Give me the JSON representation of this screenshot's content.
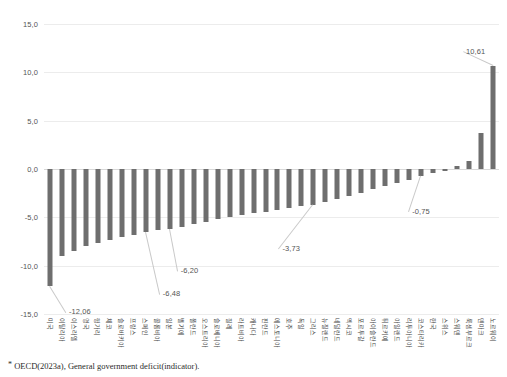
{
  "footnote": {
    "marker": "*",
    "text": "OECD(2023a), General government deficit(indicator)."
  },
  "chart_data": {
    "type": "bar",
    "title": "",
    "subtitle": "",
    "xlabel": "",
    "ylabel": "",
    "ylim": [
      -15.0,
      15.0
    ],
    "ytick_labels": [
      "15,0",
      "10,0",
      "5,0",
      "0,0",
      "-5,0",
      "-10,0",
      "-15,0"
    ],
    "ytick_values": [
      15.0,
      10.0,
      5.0,
      0.0,
      -5.0,
      -10.0,
      -15.0
    ],
    "grid": true,
    "legend": "none",
    "bar_color": "#6e6e6e",
    "categories": [
      "미국",
      "이탈리아",
      "이스라엘",
      "영국",
      "헝가리",
      "체코",
      "슬로바키아",
      "프랑스",
      "스페인",
      "콜롬비아",
      "일본",
      "벨기에",
      "폴란드",
      "오스트리아",
      "슬로베니아",
      "칠레",
      "라트비아",
      "캐나다",
      "핀란드",
      "에스토니아",
      "호주",
      "독일",
      "그리스",
      "뉴질랜드",
      "네덜란드",
      "멕시코",
      "포르투갈",
      "아이슬란드",
      "튀르키예",
      "아일랜드",
      "리투아니아",
      "코스타리카",
      "한국",
      "스위스",
      "스웨덴",
      "룩셈부르크",
      "덴마크",
      "노르웨이"
    ],
    "values": [
      -12.06,
      -9.05,
      -8.45,
      -7.95,
      -7.65,
      -7.35,
      -7.05,
      -6.8,
      -6.48,
      -6.3,
      -6.2,
      -5.95,
      -5.7,
      -5.45,
      -5.2,
      -5.0,
      -4.8,
      -4.6,
      -4.4,
      -4.2,
      -4.0,
      -3.86,
      -3.73,
      -3.4,
      -3.1,
      -2.8,
      -2.45,
      -2.1,
      -1.75,
      -1.45,
      -1.15,
      -0.75,
      -0.45,
      -0.2,
      0.35,
      0.85,
      3.7,
      10.61
    ],
    "annotations": [
      {
        "label": "-12,06",
        "value": -12.06,
        "category": "미국"
      },
      {
        "label": "-6,48",
        "value": -6.48,
        "category": "스페인"
      },
      {
        "label": "-6,20",
        "value": -6.2,
        "category": "일본"
      },
      {
        "label": "-3,73",
        "value": -3.73,
        "category": "그리스"
      },
      {
        "label": "-0,75",
        "value": -0.75,
        "category": "코스타리카"
      },
      {
        "label": "10,61",
        "value": 10.61,
        "category": "노르웨이"
      }
    ]
  }
}
